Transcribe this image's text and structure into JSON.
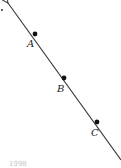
{
  "diagram": {
    "type": "line-with-points",
    "line": {
      "start": [
        8,
        3
      ],
      "end": [
        121,
        160
      ],
      "arrow_at_start": true,
      "arrow_at_end": true,
      "color": "#333333"
    },
    "points": [
      {
        "label": "A",
        "x": 35,
        "y": 34,
        "label_x": 27,
        "label_y": 47
      },
      {
        "label": "B",
        "x": 64,
        "y": 78,
        "label_x": 57,
        "label_y": 92
      },
      {
        "label": "C",
        "x": 97,
        "y": 122,
        "label_x": 91,
        "label_y": 136
      }
    ],
    "stray_dot": {
      "x": 2,
      "y": 10
    },
    "footer_text": "1998"
  }
}
